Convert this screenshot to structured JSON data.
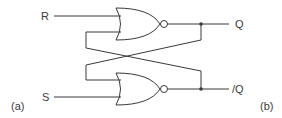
{
  "diagram": {
    "inputs": {
      "r": "R",
      "s": "S"
    },
    "outputs": {
      "q": "Q",
      "q_bar": "/Q"
    },
    "panel_labels": {
      "left": "(a)",
      "right": "(b)"
    },
    "gates": [
      {
        "name": "top-nor-gate",
        "type": "NOR",
        "inputs": [
          "R",
          "/Q"
        ],
        "output": "Q"
      },
      {
        "name": "bottom-nor-gate",
        "type": "NOR",
        "inputs": [
          "Q",
          "S"
        ],
        "output": "/Q"
      }
    ],
    "colors": {
      "line": "#3a3a3a",
      "background": "#ffffff"
    }
  }
}
